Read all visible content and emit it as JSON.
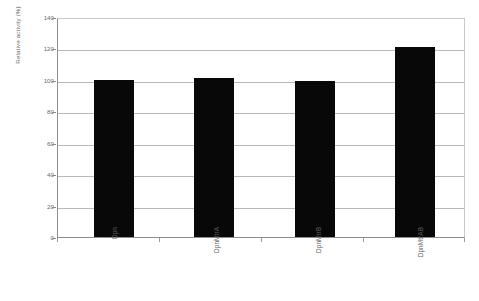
{
  "chart_data": {
    "type": "bar",
    "title": "",
    "subtitle": "",
    "xlabel": "",
    "ylabel": "Relative activity (%)",
    "categories": [
      "Dpn",
      "DpnMtrA",
      "DpnMtrB",
      "DpnMtrAB"
    ],
    "values": [
      100,
      101,
      99.5,
      121
    ],
    "series": [
      {
        "name": "Relative activity",
        "values": [
          100,
          101,
          99.5,
          121
        ]
      }
    ],
    "ylim": [
      0,
      140
    ],
    "y_ticks": [
      0,
      20,
      40,
      60,
      80,
      100,
      120,
      140
    ],
    "y_tick_labels": [
      "0",
      "20",
      "40",
      "60",
      "80",
      "100",
      "120",
      "140"
    ],
    "grid": "horizontal",
    "legend": "none",
    "bar_color": "#080808",
    "gridline_color": "#b9b9b9",
    "axis_color": "#8d8d8d",
    "background_color": "#ffffff",
    "x_tick_label_rotation": -90,
    "annotations": []
  }
}
